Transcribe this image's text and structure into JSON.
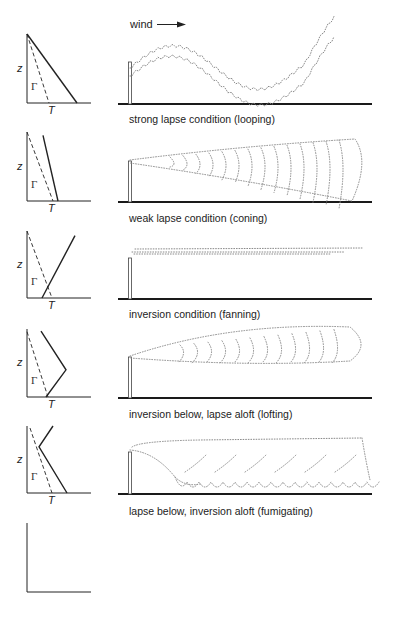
{
  "figure": {
    "wind_label": "wind",
    "axis_labels": {
      "z": "z",
      "T": "T",
      "gamma": "Γ"
    },
    "colors": {
      "ink": "#222222",
      "plume": "#8a8a8a",
      "ground": "#1a1a1a"
    },
    "panels": [
      {
        "id": "looping",
        "caption": "strong lapse condition (looping)",
        "profile": "strong-lapse",
        "plume_type": "looping"
      },
      {
        "id": "coning",
        "caption": "weak lapse condition (coning)",
        "profile": "weak-lapse",
        "plume_type": "coning"
      },
      {
        "id": "fanning",
        "caption": "inversion condition (fanning)",
        "profile": "inversion",
        "plume_type": "fanning"
      },
      {
        "id": "lofting",
        "caption": "inversion below, lapse aloft (lofting)",
        "profile": "inversion-below-lapse-aloft",
        "plume_type": "lofting"
      },
      {
        "id": "fumigating",
        "caption": "lapse below, inversion aloft (fumigating)",
        "profile": "lapse-below-inversion-aloft",
        "plume_type": "fumigating"
      },
      {
        "id": "trapping",
        "caption": "weak lapse below, inversion aloft (trapping)",
        "profile": "weak-lapse-below-inversion-aloft",
        "plume_type": "trapping"
      }
    ]
  }
}
